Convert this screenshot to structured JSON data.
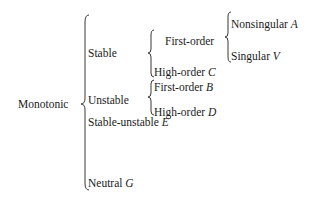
{
  "diagram": {
    "type": "classification-tree-braces",
    "root": {
      "label": "Monotonic",
      "children": [
        {
          "label": "Stable",
          "children": [
            {
              "label": "First-order",
              "children": [
                {
                  "label": "Nonsingular",
                  "symbol": "A"
                },
                {
                  "label": "Singular",
                  "symbol": "V"
                }
              ]
            },
            {
              "label": "High-order",
              "symbol": "C"
            }
          ]
        },
        {
          "label": "Unstable",
          "children": [
            {
              "label": "First-order",
              "symbol": "B"
            },
            {
              "label": "High-order",
              "symbol": "D"
            }
          ]
        },
        {
          "label": "Stable-unstable",
          "symbol": "E"
        },
        {
          "label": "Neutral",
          "symbol": "G"
        }
      ]
    }
  },
  "labels": {
    "root": "Monotonic",
    "stable": "Stable",
    "unstable": "Unstable",
    "stable_unstable": "Stable-unstable",
    "stable_unstable_sym": "E",
    "neutral": "Neutral",
    "neutral_sym": "G",
    "stable_first_order": "First-order",
    "stable_high_order": "High-order",
    "stable_high_order_sym": "C",
    "unstable_first_order": "First-order",
    "unstable_first_order_sym": "B",
    "unstable_high_order": "High-order",
    "unstable_high_order_sym": "D",
    "nonsingular": "Nonsingular",
    "nonsingular_sym": "A",
    "singular": "Singular",
    "singular_sym": "V"
  }
}
